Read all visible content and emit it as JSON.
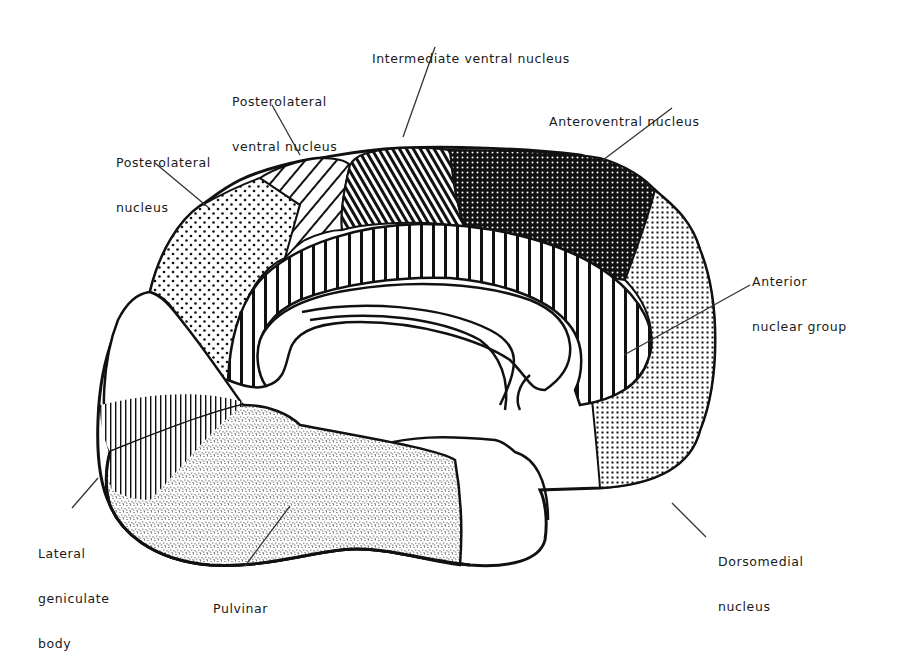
{
  "figure": {
    "type": "anatomical-diagram",
    "colors": {
      "outline": "#111111",
      "background": "#ffffff",
      "label_text": "#1a1a1a",
      "leader_line": "#333333"
    },
    "labels": {
      "intermediate_ventral": {
        "lines": [
          "Intermediate ventral nucleus"
        ]
      },
      "posterolateral_ventral": {
        "lines": [
          "Posterolateral",
          "ventral nucleus"
        ]
      },
      "anteroventral": {
        "lines": [
          "Anteroventral nucleus"
        ]
      },
      "posterolateral": {
        "lines": [
          "Posterolateral",
          "nucleus"
        ]
      },
      "anterior_group": {
        "lines": [
          "Anterior",
          "nuclear group"
        ]
      },
      "lateral_geniculate": {
        "lines": [
          "Lateral",
          "geniculate",
          "body"
        ]
      },
      "pulvinar": {
        "lines": [
          "Pulvinar"
        ]
      },
      "dorsomedial": {
        "lines": [
          "Dorsomedial",
          "nucleus"
        ]
      }
    },
    "regions": [
      {
        "name": "Intermediate ventral nucleus",
        "pattern": "dense diagonal hatching"
      },
      {
        "name": "Posterolateral ventral nucleus",
        "pattern": "sparse diagonal hatching"
      },
      {
        "name": "Anteroventral nucleus",
        "pattern": "dark stipple"
      },
      {
        "name": "Posterolateral nucleus",
        "pattern": "coarse dots"
      },
      {
        "name": "Anterior nuclear group",
        "pattern": "vertical stripes"
      },
      {
        "name": "Lateral geniculate body",
        "pattern": "fine vertical hatching"
      },
      {
        "name": "Pulvinar",
        "pattern": "fine random stipple"
      },
      {
        "name": "Dorsomedial nucleus",
        "pattern": "fine grid dots"
      }
    ]
  }
}
